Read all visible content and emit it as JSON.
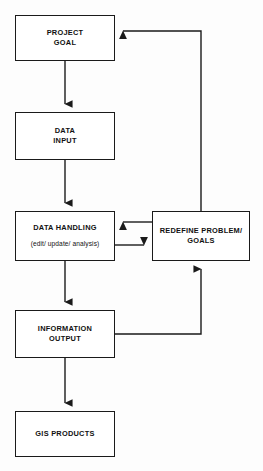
{
  "diagram": {
    "background_color": "#fdfdfd",
    "line_color": "#1a1a1a",
    "box_fill": "#ffffff",
    "nodes": {
      "project_goal": {
        "label": "PROJECT\nGOAL"
      },
      "data_input": {
        "label": "DATA\nINPUT"
      },
      "data_handling": {
        "label": "DATA HANDLING",
        "sublabel": "(edit/ update/ analysis)"
      },
      "redefine": {
        "label": "REDEFINE PROBLEM/\nGOALS"
      },
      "information_output": {
        "label": "INFORMATION\nOUTPUT"
      },
      "gis_products": {
        "label": "GIS PRODUCTS"
      }
    },
    "connectors": [
      {
        "name": "project-goal-to-data-input",
        "from": "project_goal",
        "to": "data_input",
        "direction": "down",
        "arrow": true
      },
      {
        "name": "data-input-to-data-handling",
        "from": "data_input",
        "to": "data_handling",
        "direction": "down",
        "arrow": true
      },
      {
        "name": "data-handling-to-information-output",
        "from": "data_handling",
        "to": "information_output",
        "direction": "down",
        "arrow": true
      },
      {
        "name": "information-output-to-gis-products",
        "from": "information_output",
        "to": "gis_products",
        "direction": "down",
        "arrow": true
      },
      {
        "name": "redefine-to-data-handling",
        "from": "redefine",
        "to": "data_handling",
        "direction": "left",
        "arrow": true
      },
      {
        "name": "data-handling-to-redefine",
        "from": "data_handling",
        "to": "redefine",
        "direction": "right",
        "arrow": true
      },
      {
        "name": "information-output-to-redefine-feedback",
        "from": "information_output",
        "to": "redefine",
        "direction": "up",
        "arrow": true
      },
      {
        "name": "redefine-to-project-goal-feedback",
        "from": "redefine",
        "to": "project_goal",
        "direction": "left",
        "arrow": true
      }
    ]
  }
}
